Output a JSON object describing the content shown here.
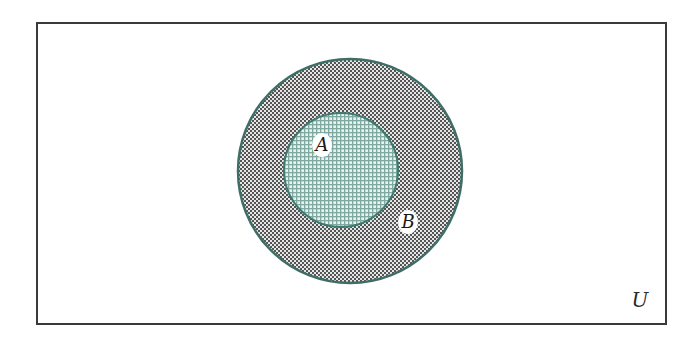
{
  "diagram": {
    "type": "venn",
    "universe": {
      "label": "U",
      "rect": {
        "x": 37,
        "y": 23,
        "width": 629,
        "height": 301
      },
      "border_color": "#3a3a3a",
      "fill": "#ffffff"
    },
    "sets": [
      {
        "id": "B",
        "label": "B",
        "circle": {
          "cx": 350,
          "cy": 171,
          "r": 112
        },
        "stroke": "#3e6e66",
        "fill_base": "#d9d9d9",
        "pattern_dot": "#4a4a4a",
        "label_pos": {
          "x": 408,
          "y": 222
        }
      },
      {
        "id": "A",
        "label": "A",
        "circle": {
          "cx": 341,
          "cy": 170,
          "r": 57
        },
        "stroke": "#3e7a70",
        "fill_base": "#cfe3de",
        "pattern_dot": "#7aa39a",
        "label_pos": {
          "x": 322,
          "y": 145
        }
      }
    ],
    "relationship": "A ⊂ B ⊂ U"
  }
}
